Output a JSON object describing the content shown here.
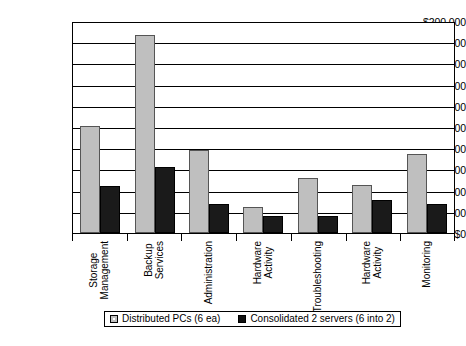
{
  "chart_data": {
    "type": "bar",
    "title": "",
    "xlabel": "",
    "ylabel": "",
    "ylim": [
      0,
      200000
    ],
    "ytick_step": 20000,
    "grid": true,
    "legend_position": "bottom",
    "value_prefix": "$",
    "categories": [
      "Storage Management",
      "Backup Services",
      "Administration",
      "Hardware Activity",
      "Troubleshooting",
      "Hardware Activity",
      "Monitoring"
    ],
    "category_lines": [
      [
        "Storage",
        "Management"
      ],
      [
        "Backup",
        "Services"
      ],
      [
        "Administration"
      ],
      [
        "Hardware",
        "Activity"
      ],
      [
        "Troubleshooting"
      ],
      [
        "Hardware",
        "Activity"
      ],
      [
        "Monitoring"
      ]
    ],
    "ytick_labels": [
      "$200,000",
      "$180,000",
      "$160,000",
      "$140,000",
      "$120,000",
      "$100,000",
      "$80,000",
      "$60,000",
      "$40,000",
      "$20,000",
      "$0"
    ],
    "ytick_values": [
      200000,
      180000,
      160000,
      140000,
      120000,
      100000,
      80000,
      60000,
      40000,
      20000,
      0
    ],
    "series": [
      {
        "name": "Distributed PCs (6 ea)",
        "color": "#bfbfbf",
        "values": [
          101000,
          187000,
          78000,
          25000,
          52000,
          45000,
          75000
        ]
      },
      {
        "name": "Consolidated 2 servers (6 into 2)",
        "color": "#1a1a1a",
        "values": [
          44000,
          62000,
          27000,
          16000,
          16000,
          31000,
          27000
        ]
      }
    ]
  },
  "legend": {
    "entries": [
      {
        "label": "Distributed PCs (6 ea)",
        "swatch": "series0"
      },
      {
        "label": "Consolidated 2 servers (6 into 2)",
        "swatch": "series1"
      }
    ]
  },
  "colors": {
    "series0": "#bfbfbf",
    "series1": "#1a1a1a",
    "axis": "#000000",
    "background": "#ffffff"
  }
}
